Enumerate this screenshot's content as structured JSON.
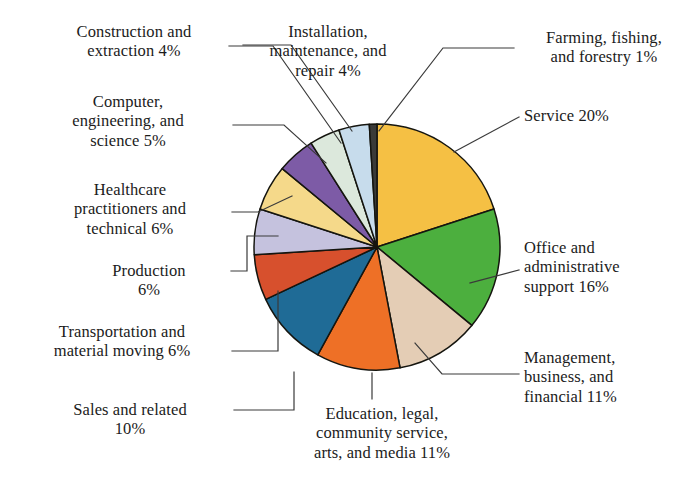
{
  "chart_data": {
    "type": "pie",
    "title": "",
    "subtitle": "",
    "xlabel": "",
    "ylabel": "",
    "legend_position": "callout-labels",
    "grid": false,
    "units": "percent",
    "start_angle_deg": 0,
    "direction": "clockwise",
    "categories": [
      "Service",
      "Office and administrative support",
      "Management, business, and financial",
      "Education, legal, community service, arts, and media",
      "Sales and related",
      "Transportation and material moving",
      "Production",
      "Healthcare practitioners and technical",
      "Computer, engineering, and science",
      "Construction and extraction",
      "Installation, maintenance, and repair",
      "Farming, fishing, and forestry"
    ],
    "values": [
      20,
      16,
      11,
      11,
      10,
      6,
      6,
      6,
      5,
      4,
      4,
      1
    ],
    "colors": [
      "#f5c044",
      "#4caf3e",
      "#e4cdb5",
      "#ee7026",
      "#1f6b96",
      "#d7502d",
      "#c5c2de",
      "#f5d98a",
      "#7d5ba6",
      "#dce8dc",
      "#c7dcec",
      "#3a3a38"
    ]
  },
  "labels": {
    "construction": "Construction and\nextraction 4%",
    "computer": "Computer,\nengineering, and\nscience 5%",
    "healthcare": "Healthcare\npractitioners and\ntechnical 6%",
    "production": "Production\n6%",
    "transportation": "Transportation and\nmaterial moving 6%",
    "sales": "Sales and related\n10%",
    "installation": "Installation,\nmaintenance, and\nrepair 4%",
    "education": "Education, legal,\ncommunity service,\narts, and media 11%",
    "farming": "Farming, fishing,\nand forestry 1%",
    "service": "Service 20%",
    "office": "Office and\nadministrative\nsupport 16%",
    "management": "Management,\nbusiness, and\nfinancial 11%"
  }
}
